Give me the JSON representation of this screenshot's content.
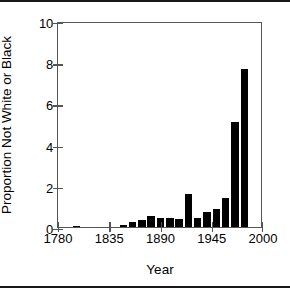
{
  "figure": {
    "background": "#ffffff",
    "bar_color": "#000000",
    "axis_color": "#555555",
    "frame_color": "#1a1a1a"
  },
  "chart_data": {
    "type": "bar",
    "title": "",
    "xlabel": "Year",
    "ylabel": "Proportion Not White or Black",
    "xlim": [
      1780,
      2000
    ],
    "ylim": [
      0,
      10
    ],
    "xticks": [
      1780,
      1835,
      1890,
      1945,
      2000
    ],
    "xticklabels": [
      "1780",
      "1835",
      "1890",
      "1945",
      "2000"
    ],
    "yticks": [
      0,
      2,
      4,
      6,
      8,
      10
    ],
    "yticklabels": [
      "0",
      "2",
      "4",
      "6",
      "8",
      "10"
    ],
    "grid": false,
    "legend": null,
    "bar_width_years": 8,
    "x": [
      1800,
      1850,
      1860,
      1870,
      1880,
      1890,
      1900,
      1910,
      1920,
      1930,
      1940,
      1950,
      1960,
      1970,
      1980,
      1990
    ],
    "values": [
      0.06,
      0.12,
      0.22,
      0.33,
      0.55,
      0.42,
      0.42,
      0.4,
      1.62,
      0.43,
      0.73,
      0.88,
      1.4,
      5.1,
      7.65,
      0.0
    ],
    "categories": [
      "1800",
      "1850",
      "1860",
      "1870",
      "1880",
      "1890",
      "1900",
      "1910",
      "1920",
      "1930",
      "1940",
      "1950",
      "1960",
      "1970",
      "1980",
      "1990"
    ],
    "series": [
      {
        "name": "Proportion Not White or Black",
        "points": [
          {
            "year": 1800,
            "value": 0.06
          },
          {
            "year": 1850,
            "value": 0.12
          },
          {
            "year": 1860,
            "value": 0.22
          },
          {
            "year": 1870,
            "value": 0.33
          },
          {
            "year": 1880,
            "value": 0.55
          },
          {
            "year": 1890,
            "value": 0.42
          },
          {
            "year": 1900,
            "value": 0.42
          },
          {
            "year": 1910,
            "value": 0.4
          },
          {
            "year": 1920,
            "value": 1.62
          },
          {
            "year": 1930,
            "value": 0.43
          },
          {
            "year": 1940,
            "value": 0.73
          },
          {
            "year": 1950,
            "value": 0.88
          },
          {
            "year": 1960,
            "value": 1.4
          },
          {
            "year": 1970,
            "value": 5.1
          },
          {
            "year": 1980,
            "value": 7.65
          }
        ]
      }
    ]
  }
}
